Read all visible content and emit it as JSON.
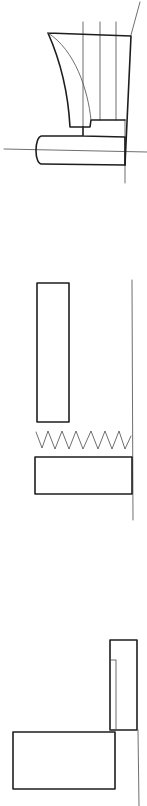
{
  "figure": {
    "width": 147,
    "height": 806,
    "background": "#ffffff",
    "stroke_color": "#1e1e1e",
    "thin_stroke_color": "#4a4a4a",
    "sketches": [
      {
        "id": "sketch-1",
        "description": "Tapered block with vertical guide lines resting on a rounded base, crossed by horizontal and vertical reference lines",
        "reference_lines": [
          {
            "x1": 4,
            "y1": 149,
            "x2": 147,
            "y2": 152
          },
          {
            "x1": 125,
            "y1": 120,
            "x2": 125,
            "y2": 183
          },
          {
            "x1": 131,
            "y1": 35,
            "x2": 140,
            "y2": 2
          }
        ],
        "guide_lines": [
          {
            "x1": 83,
            "y1": 22,
            "x2": 83,
            "y2": 127
          },
          {
            "x1": 100,
            "y1": 22,
            "x2": 100,
            "y2": 120
          },
          {
            "x1": 116,
            "y1": 22,
            "x2": 116,
            "y2": 120
          }
        ],
        "tapered_block": "M48,33 L131,36 L125,165 M48,33 C60,60 68,90 70,127 L90,127 L91,120 L125,120",
        "inner_curve": "M48,33 C75,50 88,90 91,120",
        "base_shape": "M83,127 L83,136 L42,136 C34,136 34,165 42,164 L125,165 L125,137 L83,136"
      },
      {
        "id": "sketch-2",
        "description": "Tall narrow rectangle above a zigzag spring and a wide rectangle, all against a vertical reference line",
        "reference_line": {
          "x1": 132,
          "y1": 280,
          "x2": 133,
          "y2": 520
        },
        "upper_block": {
          "x": 37,
          "y": 283,
          "width": 32,
          "height": 139
        },
        "spring_points": "36,432 42,448 48,431 55,449 62,431 69,449 76,431 83,449 91,431 98,449 105,431 112,449 119,431 125,449 131,436",
        "lower_block": {
          "x": 35,
          "y": 457,
          "width": 97,
          "height": 37
        }
      },
      {
        "id": "sketch-3",
        "description": "Tall narrow rectangle with inner strip standing on the right end of a wide lower rectangle, with a vertical reference line below",
        "tall_block": {
          "x": 110,
          "y": 640,
          "width": 27,
          "height": 90
        },
        "inner_strip": {
          "x": 110,
          "y": 660,
          "width": 6,
          "height": 70
        },
        "lower_block": {
          "x": 13,
          "y": 732,
          "width": 102,
          "height": 57
        },
        "reference_line": {
          "x1": 138,
          "y1": 730,
          "x2": 139,
          "y2": 806
        }
      }
    ]
  }
}
